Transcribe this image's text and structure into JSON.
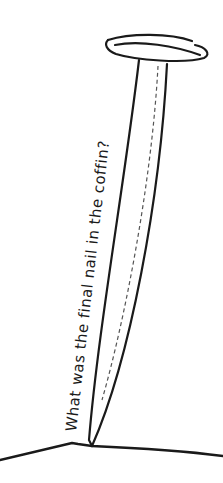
{
  "illustration": {
    "subject": "nail-driven-into-ground",
    "caption": "What was the final nail in the coffin?",
    "colors": {
      "background": "#ffffff",
      "stroke": "#1a1a1a",
      "dashed": "#555555"
    }
  }
}
